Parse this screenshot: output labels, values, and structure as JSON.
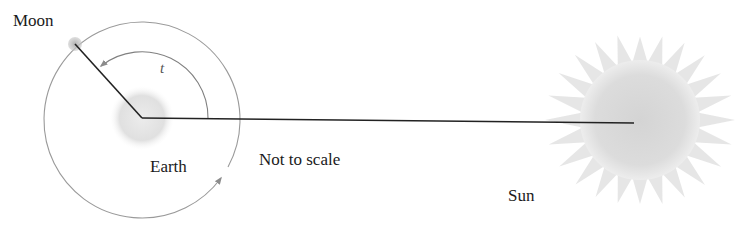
{
  "diagram": {
    "type": "astronomy-geometry",
    "labels": {
      "moon": "Moon",
      "earth": "Earth",
      "sun": "Sun",
      "angle": "t",
      "note": "Not to scale"
    },
    "colors": {
      "background": "#ffffff",
      "line": "#222222",
      "orbit": "#9a9a9a",
      "earth_fill": "#e4e4e4",
      "moon_fill": "#a8a8a8",
      "sun_fill": "#d8d8d8",
      "text": "#1a1a1a"
    },
    "elements": {
      "earth": {
        "cx": 142,
        "cy": 118,
        "r": 32
      },
      "moon": {
        "cx": 75,
        "cy": 44,
        "r": 7
      },
      "orbit": {
        "cx": 142,
        "cy": 119,
        "r": 98
      },
      "angle_arc": {
        "r": 66
      },
      "sun": {
        "cx": 640,
        "cy": 120,
        "r_body": 58,
        "r_spikes": 95,
        "spikes": 24
      },
      "earth_sun_line": {
        "x1": 142,
        "y1": 118,
        "x2": 634,
        "y2": 123
      }
    }
  }
}
